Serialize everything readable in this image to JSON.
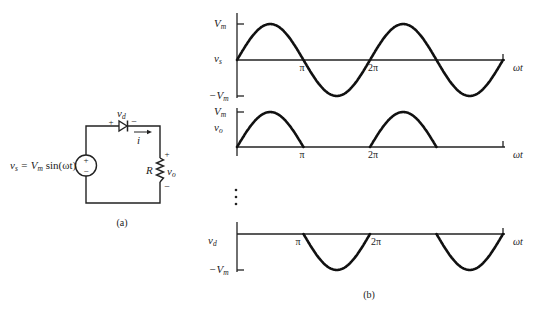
{
  "circuit": {
    "source_label": "v",
    "source_sub": "s",
    "source_eq": " = V",
    "source_eq_sub": "m",
    "source_eq_tail": " sin(ωt)",
    "source_plus": "+",
    "source_minus": "−",
    "diode_label": "v",
    "diode_sub": "d",
    "diode_plus": "+",
    "diode_minus": "−",
    "current_label": "i",
    "resistor_label": "R",
    "output_label": "v",
    "output_sub": "o",
    "output_plus": "+",
    "output_minus": "−",
    "caption": "(a)"
  },
  "waveforms": {
    "caption": "(b)",
    "ellipsis": "⋮",
    "x_axis_label": "ωt",
    "tick_pi": "π",
    "tick_2pi": "2π",
    "vs": {
      "label": "v",
      "sub": "s",
      "top": "V",
      "top_sub": "m",
      "bottom": "−V",
      "bottom_sub": "m"
    },
    "vo": {
      "label": "v",
      "sub": "o",
      "top": "V",
      "top_sub": "m"
    },
    "vd": {
      "label": "v",
      "sub": "d",
      "bottom": "−V",
      "bottom_sub": "m"
    }
  },
  "chart_data": [
    {
      "type": "line",
      "title": "v_s",
      "xlabel": "ωt",
      "ylabel": "v_s",
      "x_ticks": [
        "π",
        "2π"
      ],
      "y_ticks": [
        "V_m",
        "−V_m"
      ],
      "description": "Full sine wave v_s = V_m sin(ωt), two cycles from 0 to 4π",
      "x": [
        0,
        0.5,
        1,
        1.5,
        2,
        2.5,
        3,
        3.5,
        4
      ],
      "x_unit": "π rad",
      "values": [
        0,
        1,
        0,
        -1,
        0,
        1,
        0,
        -1,
        0
      ],
      "ylim": [
        -1,
        1
      ]
    },
    {
      "type": "line",
      "title": "v_o",
      "xlabel": "ωt",
      "ylabel": "v_o",
      "x_ticks": [
        "π",
        "2π"
      ],
      "y_ticks": [
        "V_m"
      ],
      "description": "Half-wave rectified output: positive half-cycles pass, zero during negative half-cycles",
      "x": [
        0,
        0.5,
        1,
        1.5,
        2,
        2.5,
        3,
        3.5,
        4
      ],
      "x_unit": "π rad",
      "values": [
        0,
        1,
        0,
        0,
        0,
        1,
        0,
        0,
        0
      ],
      "ylim": [
        0,
        1
      ]
    },
    {
      "type": "line",
      "title": "v_d",
      "xlabel": "ωt",
      "ylabel": "v_d",
      "x_ticks": [
        "π",
        "2π"
      ],
      "y_ticks": [
        "−V_m"
      ],
      "description": "Diode voltage: zero during positive half-cycles, follows v_s during negative half-cycles",
      "x": [
        0,
        0.5,
        1,
        1.5,
        2,
        2.5,
        3,
        3.5,
        4
      ],
      "x_unit": "π rad",
      "values": [
        0,
        0,
        0,
        -1,
        0,
        0,
        0,
        -1,
        0
      ],
      "ylim": [
        -1,
        0
      ]
    }
  ]
}
